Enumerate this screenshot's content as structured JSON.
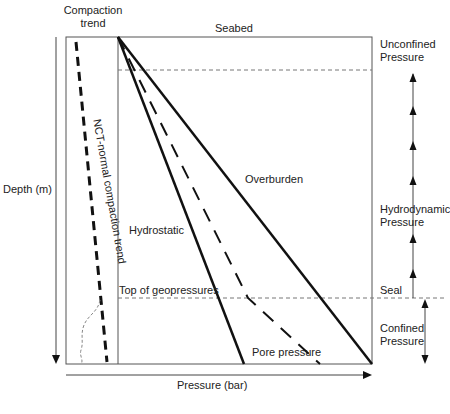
{
  "labels": {
    "compaction_trend_line1": "Compaction",
    "compaction_trend_line2": "trend",
    "seabed": "Seabed",
    "unconfined_line1": "Unconfined",
    "unconfined_line2": "Pressure",
    "nct": "NCT-normal compaction trend",
    "depth_axis": "Depth (m)",
    "overburden": "Overburden",
    "hydrostatic": "Hydrostatic",
    "hydrodynamic_line1": "Hydrodynamic",
    "hydrodynamic_line2": "Pressure",
    "top_geopressures": "Top of geopressures",
    "seal": "Seal",
    "confined_line1": "Confined",
    "confined_line2": "Pressure",
    "pore_pressure": "Pore pressure",
    "pressure_axis": "Pressure (bar)"
  },
  "colors": {
    "line": "#111111",
    "frame": "#555555",
    "dashed": "#777777"
  }
}
